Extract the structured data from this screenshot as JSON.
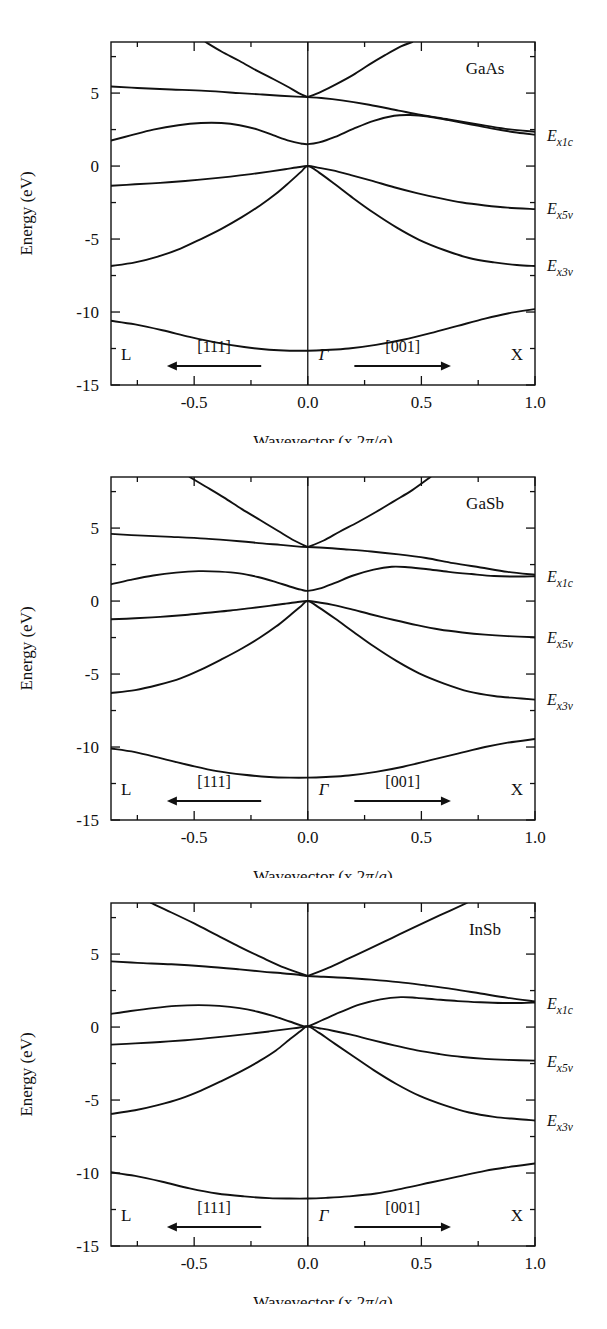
{
  "figure": {
    "kind": "band-structure-panels",
    "panel_count": 3,
    "axis": {
      "ylabel": "Energy (eV)",
      "xlabel_prefix": "Wavevector (x 2",
      "xlabel_pi": "π",
      "xlabel_slash": "/",
      "xlabel_a": "a",
      "xlabel_suffix": ")",
      "xlabel_full": "Wavevector (x 2π/a)",
      "yticks": [
        "5",
        "0",
        "-5",
        "-10",
        "-15"
      ],
      "ytick_values": [
        5,
        0,
        -5,
        -10,
        -15
      ],
      "xticks": [
        "-0.5",
        "0.0",
        "0.5",
        "1.0"
      ],
      "xtick_values": [
        -0.5,
        0.0,
        0.5,
        1.0
      ],
      "xlim": [
        -0.866,
        1.0
      ],
      "ylim": [
        -15,
        8.5
      ],
      "grid": false
    },
    "symmetry_points": {
      "left": "L",
      "center": "Γ",
      "right": "X"
    },
    "directions": {
      "left_label": "[111]",
      "left_arrow": "left",
      "right_label": "[001]",
      "right_arrow": "right"
    },
    "band_labels": [
      {
        "key": "ex1c",
        "base": "E",
        "sub": "x1c",
        "full": "Ex1c"
      },
      {
        "key": "ex5v",
        "base": "E",
        "sub": "x5v",
        "full": "Ex5v"
      },
      {
        "key": "ex3v",
        "base": "E",
        "sub": "x3v",
        "full": "Ex3v"
      }
    ],
    "colors": {
      "line": "#111111",
      "background": "#ffffff"
    }
  },
  "chart_data": [
    {
      "type": "line",
      "title": "GaAs",
      "xlabel": "Wavevector (x 2π/a)",
      "ylabel": "Energy (eV)",
      "xlim": [
        -0.866,
        1.0
      ],
      "ylim": [
        -15,
        8.5
      ],
      "label_positions": {
        "ex1c": 2.1,
        "ex5v": -2.9,
        "ex3v": -6.8
      },
      "series": [
        {
          "name": "conduction-upper-c2",
          "x": [
            -0.866,
            -0.75,
            -0.6,
            -0.45,
            -0.3,
            -0.2,
            -0.12,
            -0.05,
            0.0,
            0.06,
            0.15,
            0.27,
            0.4,
            0.5,
            0.62,
            0.75,
            0.87,
            1.0
          ],
          "y": [
            5.45,
            5.35,
            5.25,
            5.15,
            5.0,
            4.9,
            4.82,
            4.76,
            4.72,
            4.66,
            4.5,
            4.2,
            3.8,
            3.5,
            3.2,
            2.85,
            2.55,
            2.35
          ]
        },
        {
          "name": "conduction-steep-left",
          "x": [
            -0.45,
            -0.38,
            -0.3,
            -0.22,
            -0.15,
            -0.09,
            -0.04,
            0.0
          ],
          "y": [
            8.5,
            7.85,
            7.2,
            6.5,
            5.95,
            5.45,
            5.0,
            4.72
          ]
        },
        {
          "name": "conduction-steep-right",
          "x": [
            0.0,
            0.06,
            0.13,
            0.2,
            0.27,
            0.34,
            0.41,
            0.46
          ],
          "y": [
            4.72,
            5.1,
            5.65,
            6.25,
            6.95,
            7.6,
            8.2,
            8.5
          ]
        },
        {
          "name": "conduction-gamma1c",
          "x": [
            -0.866,
            -0.78,
            -0.68,
            -0.57,
            -0.47,
            -0.38,
            -0.3,
            -0.22,
            -0.15,
            -0.08,
            -0.03,
            0.0,
            0.05,
            0.12,
            0.2,
            0.29,
            0.38,
            0.45,
            0.53,
            0.62,
            0.72,
            0.82,
            0.92,
            1.0
          ],
          "y": [
            1.75,
            2.1,
            2.5,
            2.8,
            2.95,
            2.95,
            2.8,
            2.5,
            2.1,
            1.72,
            1.55,
            1.5,
            1.62,
            2.0,
            2.55,
            3.1,
            3.45,
            3.5,
            3.4,
            3.15,
            2.85,
            2.55,
            2.3,
            2.15
          ]
        },
        {
          "name": "valence-heavy-hole",
          "x": [
            -0.866,
            -0.76,
            -0.65,
            -0.54,
            -0.44,
            -0.34,
            -0.25,
            -0.17,
            -0.1,
            -0.05,
            0.0,
            0.05,
            0.11,
            0.19,
            0.28,
            0.38,
            0.48,
            0.58,
            0.68,
            0.78,
            0.88,
            1.0
          ],
          "y": [
            -1.35,
            -1.25,
            -1.15,
            -1.02,
            -0.88,
            -0.72,
            -0.55,
            -0.38,
            -0.22,
            -0.1,
            0.0,
            -0.12,
            -0.3,
            -0.62,
            -1.0,
            -1.45,
            -1.85,
            -2.2,
            -2.5,
            -2.7,
            -2.85,
            -2.95
          ]
        },
        {
          "name": "valence-light-hole",
          "x": [
            -0.866,
            -0.76,
            -0.66,
            -0.56,
            -0.47,
            -0.38,
            -0.29,
            -0.21,
            -0.14,
            -0.08,
            -0.03,
            0.0,
            0.05,
            0.12,
            0.2,
            0.29,
            0.39,
            0.49,
            0.6,
            0.71,
            0.82,
            0.92,
            1.0
          ],
          "y": [
            -6.85,
            -6.6,
            -6.2,
            -5.65,
            -5.0,
            -4.3,
            -3.5,
            -2.7,
            -1.9,
            -1.1,
            -0.4,
            0.0,
            -0.45,
            -1.25,
            -2.2,
            -3.2,
            -4.2,
            -5.05,
            -5.75,
            -6.3,
            -6.6,
            -6.78,
            -6.85
          ]
        },
        {
          "name": "valence-lowest",
          "x": [
            -0.866,
            -0.76,
            -0.64,
            -0.52,
            -0.4,
            -0.28,
            -0.17,
            -0.08,
            0.0,
            0.08,
            0.18,
            0.3,
            0.42,
            0.54,
            0.66,
            0.78,
            0.88,
            1.0
          ],
          "y": [
            -10.6,
            -10.85,
            -11.25,
            -11.7,
            -12.1,
            -12.4,
            -12.58,
            -12.65,
            -12.65,
            -12.6,
            -12.5,
            -12.25,
            -11.9,
            -11.45,
            -10.95,
            -10.45,
            -10.1,
            -9.8
          ]
        }
      ]
    },
    {
      "type": "line",
      "title": "GaSb",
      "xlabel": "Wavevector (x 2π/a)",
      "ylabel": "Energy (eV)",
      "xlim": [
        -0.866,
        1.0
      ],
      "ylim": [
        -15,
        8.5
      ],
      "label_positions": {
        "ex1c": 1.75,
        "ex5v": -2.45,
        "ex3v": -6.7
      },
      "series": [
        {
          "name": "conduction-upper-c2",
          "x": [
            -0.866,
            -0.75,
            -0.6,
            -0.45,
            -0.3,
            -0.2,
            -0.12,
            -0.05,
            0.0,
            0.07,
            0.16,
            0.28,
            0.4,
            0.52,
            0.64,
            0.76,
            0.88,
            1.0
          ],
          "y": [
            4.6,
            4.5,
            4.4,
            4.28,
            4.1,
            3.95,
            3.85,
            3.75,
            3.7,
            3.65,
            3.55,
            3.4,
            3.2,
            2.95,
            2.6,
            2.3,
            2.0,
            1.8
          ]
        },
        {
          "name": "conduction-steep-left",
          "x": [
            -0.52,
            -0.45,
            -0.37,
            -0.29,
            -0.21,
            -0.13,
            -0.06,
            0.0
          ],
          "y": [
            8.5,
            7.85,
            7.1,
            6.3,
            5.55,
            4.8,
            4.15,
            3.7
          ]
        },
        {
          "name": "conduction-steep-right",
          "x": [
            0.0,
            0.07,
            0.14,
            0.22,
            0.3,
            0.38,
            0.46,
            0.54
          ],
          "y": [
            3.7,
            4.15,
            4.75,
            5.4,
            6.1,
            6.85,
            7.6,
            8.5
          ]
        },
        {
          "name": "conduction-gamma1c",
          "x": [
            -0.866,
            -0.78,
            -0.68,
            -0.58,
            -0.48,
            -0.39,
            -0.3,
            -0.22,
            -0.15,
            -0.08,
            -0.03,
            0.0,
            0.05,
            0.12,
            0.2,
            0.29,
            0.37,
            0.44,
            0.52,
            0.62,
            0.72,
            0.82,
            0.92,
            1.0
          ],
          "y": [
            1.15,
            1.45,
            1.75,
            1.95,
            2.05,
            2.02,
            1.9,
            1.65,
            1.35,
            1.0,
            0.78,
            0.7,
            0.85,
            1.25,
            1.75,
            2.15,
            2.35,
            2.32,
            2.2,
            2.0,
            1.85,
            1.72,
            1.68,
            1.7
          ]
        },
        {
          "name": "valence-heavy-hole",
          "x": [
            -0.866,
            -0.76,
            -0.65,
            -0.54,
            -0.44,
            -0.34,
            -0.25,
            -0.17,
            -0.1,
            -0.05,
            0.0,
            0.05,
            0.11,
            0.19,
            0.28,
            0.38,
            0.48,
            0.58,
            0.68,
            0.78,
            0.88,
            1.0
          ],
          "y": [
            -1.25,
            -1.18,
            -1.08,
            -0.95,
            -0.8,
            -0.65,
            -0.48,
            -0.33,
            -0.18,
            -0.08,
            0.0,
            -0.1,
            -0.26,
            -0.55,
            -0.92,
            -1.3,
            -1.65,
            -1.95,
            -2.15,
            -2.3,
            -2.4,
            -2.48
          ]
        },
        {
          "name": "valence-light-hole",
          "x": [
            -0.866,
            -0.76,
            -0.66,
            -0.56,
            -0.47,
            -0.38,
            -0.29,
            -0.21,
            -0.14,
            -0.08,
            -0.03,
            0.0,
            0.05,
            0.12,
            0.2,
            0.29,
            0.39,
            0.49,
            0.6,
            0.71,
            0.82,
            0.92,
            1.0
          ],
          "y": [
            -6.3,
            -6.1,
            -5.75,
            -5.3,
            -4.7,
            -4.0,
            -3.25,
            -2.5,
            -1.75,
            -1.0,
            -0.35,
            0.0,
            -0.45,
            -1.2,
            -2.1,
            -3.1,
            -4.1,
            -4.95,
            -5.65,
            -6.2,
            -6.5,
            -6.65,
            -6.75
          ]
        },
        {
          "name": "valence-lowest",
          "x": [
            -0.866,
            -0.76,
            -0.64,
            -0.52,
            -0.4,
            -0.28,
            -0.17,
            -0.08,
            0.0,
            0.08,
            0.18,
            0.3,
            0.42,
            0.54,
            0.66,
            0.78,
            0.88,
            1.0
          ],
          "y": [
            -10.1,
            -10.35,
            -10.8,
            -11.25,
            -11.65,
            -11.9,
            -12.05,
            -12.1,
            -12.1,
            -12.05,
            -11.95,
            -11.7,
            -11.35,
            -10.9,
            -10.45,
            -10.0,
            -9.7,
            -9.45
          ]
        }
      ]
    },
    {
      "type": "line",
      "title": "InSb",
      "xlabel": "Wavevector (x 2π/a)",
      "ylabel": "Energy (eV)",
      "xlim": [
        -0.866,
        1.0
      ],
      "ylim": [
        -15,
        8.5
      ],
      "label_positions": {
        "ex1c": 1.65,
        "ex5v": -2.3,
        "ex3v": -6.35
      },
      "series": [
        {
          "name": "conduction-upper-c2",
          "x": [
            -0.866,
            -0.75,
            -0.6,
            -0.45,
            -0.3,
            -0.2,
            -0.12,
            -0.05,
            0.0,
            0.07,
            0.16,
            0.28,
            0.4,
            0.52,
            0.64,
            0.76,
            0.88,
            1.0
          ],
          "y": [
            4.5,
            4.4,
            4.3,
            4.15,
            3.95,
            3.8,
            3.7,
            3.6,
            3.5,
            3.45,
            3.38,
            3.25,
            3.08,
            2.85,
            2.6,
            2.3,
            2.0,
            1.75
          ]
        },
        {
          "name": "conduction-steep-left",
          "x": [
            -0.69,
            -0.6,
            -0.5,
            -0.4,
            -0.3,
            -0.2,
            -0.1,
            0.0
          ],
          "y": [
            8.5,
            7.85,
            7.1,
            6.3,
            5.5,
            4.75,
            4.05,
            3.5
          ]
        },
        {
          "name": "conduction-steep-right",
          "x": [
            0.0,
            0.09,
            0.18,
            0.27,
            0.37,
            0.47,
            0.58,
            0.7
          ],
          "y": [
            3.5,
            4.05,
            4.7,
            5.35,
            6.1,
            6.85,
            7.65,
            8.5
          ]
        },
        {
          "name": "conduction-gamma1c",
          "x": [
            -0.866,
            -0.78,
            -0.68,
            -0.58,
            -0.48,
            -0.39,
            -0.3,
            -0.22,
            -0.15,
            -0.08,
            -0.03,
            0.0,
            0.06,
            0.14,
            0.23,
            0.32,
            0.41,
            0.48,
            0.56,
            0.66,
            0.76,
            0.86,
            0.94,
            1.0
          ],
          "y": [
            0.9,
            1.1,
            1.3,
            1.45,
            1.5,
            1.45,
            1.3,
            1.05,
            0.75,
            0.38,
            0.12,
            0.05,
            0.45,
            1.0,
            1.55,
            1.9,
            2.05,
            2.0,
            1.9,
            1.78,
            1.7,
            1.65,
            1.65,
            1.68
          ]
        },
        {
          "name": "valence-heavy-hole",
          "x": [
            -0.866,
            -0.76,
            -0.65,
            -0.54,
            -0.44,
            -0.34,
            -0.25,
            -0.17,
            -0.1,
            -0.05,
            0.0,
            0.05,
            0.11,
            0.19,
            0.28,
            0.38,
            0.48,
            0.58,
            0.68,
            0.78,
            0.88,
            1.0
          ],
          "y": [
            -1.2,
            -1.12,
            -1.02,
            -0.9,
            -0.76,
            -0.6,
            -0.45,
            -0.3,
            -0.16,
            -0.06,
            0.05,
            -0.08,
            -0.25,
            -0.52,
            -0.88,
            -1.25,
            -1.6,
            -1.85,
            -2.05,
            -2.18,
            -2.25,
            -2.3
          ]
        },
        {
          "name": "valence-light-hole",
          "x": [
            -0.866,
            -0.76,
            -0.66,
            -0.56,
            -0.47,
            -0.38,
            -0.29,
            -0.21,
            -0.14,
            -0.08,
            -0.03,
            0.0,
            0.05,
            0.12,
            0.2,
            0.29,
            0.39,
            0.49,
            0.6,
            0.71,
            0.82,
            0.92,
            1.0
          ],
          "y": [
            -5.95,
            -5.7,
            -5.35,
            -4.9,
            -4.35,
            -3.7,
            -3.0,
            -2.3,
            -1.6,
            -0.85,
            -0.25,
            0.05,
            -0.4,
            -1.15,
            -2.0,
            -2.95,
            -3.9,
            -4.7,
            -5.35,
            -5.85,
            -6.15,
            -6.3,
            -6.4
          ]
        },
        {
          "name": "valence-lowest",
          "x": [
            -0.866,
            -0.76,
            -0.64,
            -0.52,
            -0.4,
            -0.28,
            -0.17,
            -0.08,
            0.0,
            0.08,
            0.18,
            0.3,
            0.42,
            0.54,
            0.66,
            0.78,
            0.88,
            1.0
          ],
          "y": [
            -9.95,
            -10.2,
            -10.6,
            -11.05,
            -11.4,
            -11.6,
            -11.72,
            -11.75,
            -11.75,
            -11.7,
            -11.6,
            -11.4,
            -11.05,
            -10.65,
            -10.25,
            -9.85,
            -9.6,
            -9.35
          ]
        }
      ]
    }
  ]
}
